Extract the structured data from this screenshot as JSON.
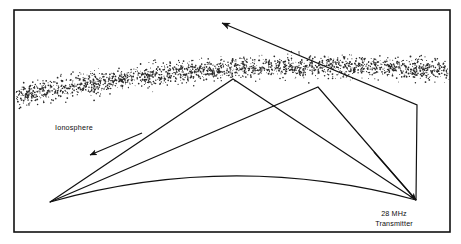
{
  "figure": {
    "kind": "ionospheric-skip-propagation-diagram",
    "frame": {
      "stroke_color": "#111111",
      "fill_color": "#ffffff",
      "x": 14,
      "y": 10,
      "width": 436,
      "height": 222
    },
    "labels": {
      "ionosphere": "Ionosphere",
      "transmitter_line1": "28 MHz",
      "transmitter_line2": "Transmitter"
    },
    "ionosphere_band": {
      "name": "ionosphere",
      "style": "stippled",
      "dot_color": "#2a2a2a",
      "dot_count": 2600,
      "top_left_y": 78,
      "top_right_y": 52,
      "thickness": 36,
      "arc_rise": 16
    },
    "earth": {
      "name": "earth-surface-arc",
      "stroke_color": "#111111",
      "left_x": 50,
      "left_y": 202,
      "right_x": 416,
      "right_y": 200,
      "apex_y": 176
    },
    "transmitter": {
      "name": "transmitter-site",
      "x": 416,
      "y": 200
    },
    "ray_paths": [
      {
        "name": "two-hop-skip-path",
        "description": "Signal leaves transmitter, reflects off ionosphere at first apex, reaches ground at left, reflects up through ionosphere",
        "points": [
          [
            416,
            200
          ],
          [
            233,
            79
          ],
          [
            50,
            202
          ],
          [
            233,
            79
          ]
        ],
        "stroke_color": "#111111"
      },
      {
        "name": "single-hop-skip-path",
        "description": "Signal leaves transmitter, reflects off ionosphere at second apex, returns toward ground at left",
        "points": [
          [
            416,
            200
          ],
          [
            318,
            87
          ],
          [
            50,
            202
          ]
        ],
        "stroke_color": "#111111"
      },
      {
        "name": "escape-ray-path",
        "description": "Signal leaves transmitter vertically then penetrates the ionosphere and escapes into space",
        "points": [
          [
            416,
            200
          ],
          [
            417,
            105
          ],
          [
            222,
            23
          ]
        ],
        "stroke_color": "#111111"
      }
    ],
    "arrows": [
      {
        "name": "escape-arrow",
        "direction": "up-left",
        "tip_x": 222,
        "tip_y": 23
      },
      {
        "name": "downward-ray-arrow",
        "direction": "down-left",
        "tip_x": 90,
        "tip_y": 155
      },
      {
        "name": "transmitter-arrow",
        "direction": "down-right",
        "tip_x": 416,
        "tip_y": 200
      }
    ],
    "colors": {
      "ink": "#111111",
      "paper": "#ffffff",
      "stipple": "#2a2a2a"
    }
  }
}
